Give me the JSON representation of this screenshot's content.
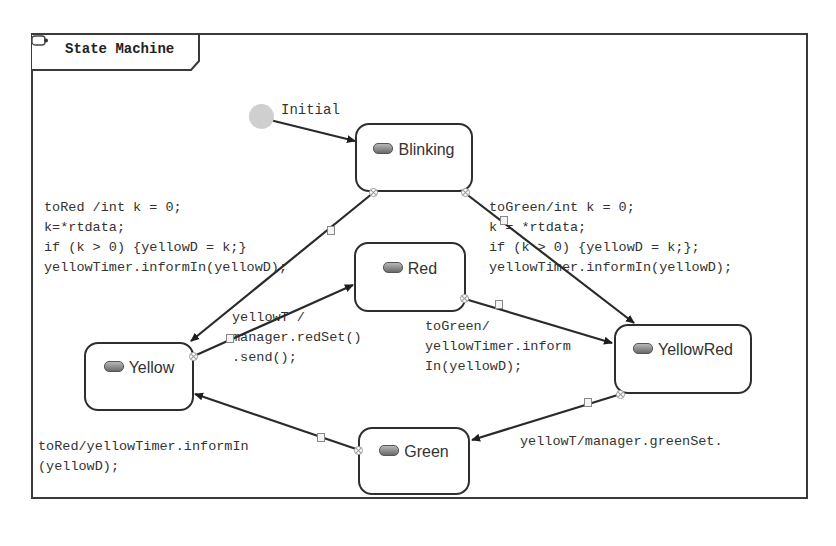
{
  "diagram": {
    "title": "State Machine",
    "title_icon": "state-machine-icon",
    "initial": {
      "label": "Initial"
    },
    "states": [
      {
        "id": "blinking",
        "label": "Blinking",
        "icon": "state-icon"
      },
      {
        "id": "red",
        "label": "Red",
        "icon": "state-icon"
      },
      {
        "id": "yellow",
        "label": "Yellow",
        "icon": "state-icon"
      },
      {
        "id": "yellowred",
        "label": "YellowRed",
        "icon": "state-icon"
      },
      {
        "id": "green",
        "label": "Green",
        "icon": "state-icon"
      }
    ],
    "transitions": [
      {
        "from": "initial",
        "to": "blinking",
        "label": ""
      },
      {
        "from": "blinking",
        "to": "yellow",
        "label": "toRed /int k = 0;\nk=*rtdata;\nif (k > 0) {yellowD = k;}\nyellowTimer.informIn(yellowD);"
      },
      {
        "from": "blinking",
        "to": "yellowred",
        "label": "toGreen/int k = 0;\nk = *rtdata;\nif (k > 0) {yellowD = k;};\nyellowTimer.informIn(yellowD);"
      },
      {
        "from": "yellow",
        "to": "red",
        "label": "yellowT /\nmanager.redSet()\n.send();"
      },
      {
        "from": "red",
        "to": "yellowred",
        "label": "toGreen/\nyellowTimer.inform\nIn(yellowD);"
      },
      {
        "from": "yellowred",
        "to": "green",
        "label": "yellowT/manager.greenSet."
      },
      {
        "from": "green",
        "to": "yellow",
        "label": "toRed/yellowTimer.informIn\n(yellowD);"
      }
    ]
  }
}
